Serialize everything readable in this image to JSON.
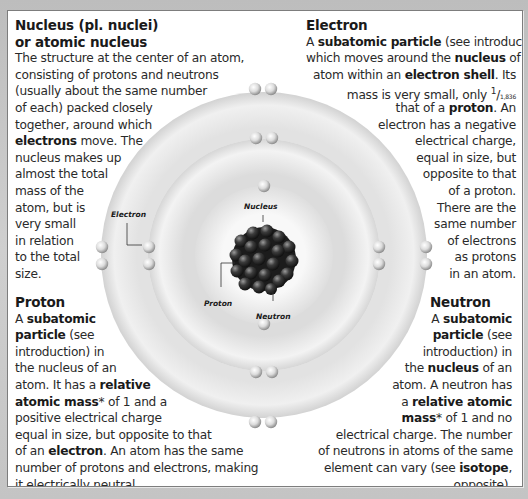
{
  "colors": {
    "background": "#c9c9c9",
    "panel": "#ffffff",
    "panel_border": "#7d7d7d",
    "text": "#2a2a2a",
    "shell_light": "#f4f4f4",
    "shell_dark": "#d4d4d4",
    "nucleus_particle": "#3a3a3a"
  },
  "sections": {
    "nucleus": {
      "heading": [
        [
          {
            "t": "Nucleus",
            "b": true
          },
          {
            "t": " (pl. "
          },
          {
            "t": "nuclei",
            "b": true
          },
          {
            "t": ")"
          }
        ],
        [
          {
            "t": "or "
          },
          {
            "t": "atomic nucleus",
            "b": true
          }
        ]
      ],
      "lines": [
        [
          {
            "t": "The structure at the center of an atom,"
          }
        ],
        [
          {
            "t": "consisting of protons and neutrons"
          }
        ],
        [
          {
            "t": "(usually about the same number"
          }
        ],
        [
          {
            "t": "of each) packed closely"
          }
        ],
        [
          {
            "t": "together, around which"
          }
        ],
        [
          {
            "t": "electrons",
            "b": true
          },
          {
            "t": " move. The"
          }
        ],
        [
          {
            "t": "nucleus makes up"
          }
        ],
        [
          {
            "t": "almost the total"
          }
        ],
        [
          {
            "t": "mass of the"
          }
        ],
        [
          {
            "t": "atom, but is"
          }
        ],
        [
          {
            "t": "very small"
          }
        ],
        [
          {
            "t": "in relation"
          }
        ],
        [
          {
            "t": "to the total"
          }
        ],
        [
          {
            "t": "size."
          }
        ]
      ]
    },
    "electron": {
      "heading": "Electron",
      "lines": [
        [
          {
            "t": "A "
          },
          {
            "t": "subatomic particle",
            "b": true
          },
          {
            "t": " (see introduction)"
          }
        ],
        [
          {
            "t": "which moves around the "
          },
          {
            "t": "nucleus",
            "b": true
          },
          {
            "t": " of an"
          }
        ],
        [
          {
            "t": "atom within an "
          },
          {
            "t": "electron shell",
            "b": true
          },
          {
            "t": ". Its"
          }
        ],
        [
          {
            "t": "mass is very small, only "
          },
          {
            "t": "1/1,836",
            "frac": true
          }
        ],
        [
          {
            "t": "that of a "
          },
          {
            "t": "proton",
            "b": true
          },
          {
            "t": ". An"
          }
        ],
        [
          {
            "t": "electron has a negative"
          }
        ],
        [
          {
            "t": "electrical charge,"
          }
        ],
        [
          {
            "t": "equal in size, but"
          }
        ],
        [
          {
            "t": "opposite to that"
          }
        ],
        [
          {
            "t": "of a proton."
          }
        ],
        [
          {
            "t": "There are the"
          }
        ],
        [
          {
            "t": "same number"
          }
        ],
        [
          {
            "t": "of electrons"
          }
        ],
        [
          {
            "t": "as protons"
          }
        ],
        [
          {
            "t": "in an atom."
          }
        ]
      ]
    },
    "proton": {
      "heading": "Proton",
      "lines": [
        [
          {
            "t": "A "
          },
          {
            "t": "subatomic",
            "b": true
          }
        ],
        [
          {
            "t": "particle",
            "b": true
          },
          {
            "t": " (see"
          }
        ],
        [
          {
            "t": "introduction) in"
          }
        ],
        [
          {
            "t": "the nucleus of an"
          }
        ],
        [
          {
            "t": "atom. It has a "
          },
          {
            "t": "relative",
            "b": true
          }
        ],
        [
          {
            "t": "atomic mass",
            "b": true
          },
          {
            "t": "* of 1 and a"
          }
        ],
        [
          {
            "t": "positive electrical charge"
          }
        ],
        [
          {
            "t": "equal in size, but opposite to that"
          }
        ],
        [
          {
            "t": "of an "
          },
          {
            "t": "electron",
            "b": true
          },
          {
            "t": ". An atom has the same"
          }
        ],
        [
          {
            "t": "number of protons and electrons, making"
          }
        ],
        [
          {
            "t": "it electrically neutral."
          }
        ]
      ]
    },
    "neutron": {
      "heading": "Neutron",
      "lines": [
        [
          {
            "t": "A "
          },
          {
            "t": "subatomic",
            "b": true
          }
        ],
        [
          {
            "t": "particle",
            "b": true
          },
          {
            "t": " (see"
          }
        ],
        [
          {
            "t": "introduction) in"
          }
        ],
        [
          {
            "t": "the "
          },
          {
            "t": "nucleus",
            "b": true
          },
          {
            "t": " of an"
          }
        ],
        [
          {
            "t": "atom. A neutron has"
          }
        ],
        [
          {
            "t": "a "
          },
          {
            "t": "relative atomic",
            "b": true
          }
        ],
        [
          {
            "t": "mass",
            "b": true
          },
          {
            "t": "* of 1 and no"
          }
        ],
        [
          {
            "t": "electrical charge. The number"
          }
        ],
        [
          {
            "t": "of neutrons in atoms of the same"
          }
        ],
        [
          {
            "t": "element can vary (see "
          },
          {
            "t": "isotope",
            "b": true
          },
          {
            "t": ","
          }
        ],
        [
          {
            "t": "opposite)."
          }
        ]
      ]
    }
  },
  "diagram": {
    "labels": {
      "nucleus": "Nucleus",
      "electron": "Electron",
      "proton": "Proton",
      "neutron": "Neutron"
    },
    "shells": [
      {
        "name": "outer-shell",
        "radius": 163,
        "electron_count": 8
      },
      {
        "name": "middle-shell",
        "radius": 116,
        "electron_count": 8
      },
      {
        "name": "inner-shell",
        "radius": 69,
        "electron_count": 2
      }
    ]
  }
}
